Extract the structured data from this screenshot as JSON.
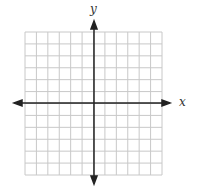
{
  "diagram": {
    "type": "coordinate-grid",
    "x_axis_label": "x",
    "y_axis_label": "y",
    "grid": {
      "columns": 12,
      "rows": 12,
      "left": 25,
      "top": 32,
      "right": 162,
      "bottom": 175
    },
    "colors": {
      "grid": "#c8c8c8",
      "axis": "#222222",
      "label": "#333333"
    }
  }
}
